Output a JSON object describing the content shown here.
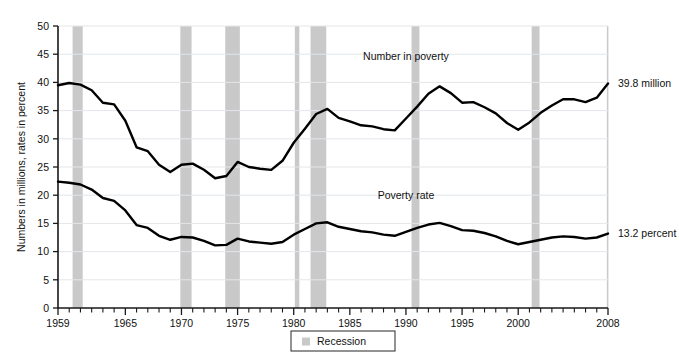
{
  "chart_data": {
    "type": "line",
    "title": "",
    "subtitle": "",
    "xlabel": "",
    "ylabel": "Numbers in millions, rates in percent",
    "xlim": [
      1959,
      2008
    ],
    "ylim": [
      0,
      50
    ],
    "grid": true,
    "legend_position": "bottom-center",
    "x": [
      1959,
      1960,
      1961,
      1962,
      1963,
      1964,
      1965,
      1966,
      1967,
      1968,
      1969,
      1970,
      1971,
      1972,
      1973,
      1974,
      1975,
      1976,
      1977,
      1978,
      1979,
      1980,
      1981,
      1982,
      1983,
      1984,
      1985,
      1986,
      1987,
      1988,
      1989,
      1990,
      1991,
      1992,
      1993,
      1994,
      1995,
      1996,
      1997,
      1998,
      1999,
      2000,
      2001,
      2002,
      2003,
      2004,
      2005,
      2006,
      2007,
      2008
    ],
    "x_tick_labels": [
      "1959",
      "1965",
      "1970",
      "1975",
      "1980",
      "1985",
      "1990",
      "1995",
      "2000",
      "2008"
    ],
    "x_tick_values": [
      1959,
      1965,
      1970,
      1975,
      1980,
      1985,
      1990,
      1995,
      2000,
      2008
    ],
    "x_minor_tick_step": 1,
    "y_tick_labels": [
      "0",
      "5",
      "10",
      "15",
      "20",
      "25",
      "30",
      "35",
      "40",
      "45",
      "50"
    ],
    "y_tick_values": [
      0,
      5,
      10,
      15,
      20,
      25,
      30,
      35,
      40,
      45,
      50
    ],
    "series": [
      {
        "name": "Number in poverty",
        "unit": "millions",
        "label_x": 1990,
        "label_y": 44.0,
        "end_label": "39.8 million",
        "color": "#000000",
        "values": [
          39.5,
          39.9,
          39.6,
          38.6,
          36.4,
          36.1,
          33.2,
          28.5,
          27.8,
          25.4,
          24.1,
          25.4,
          25.6,
          24.5,
          23.0,
          23.4,
          25.9,
          25.0,
          24.7,
          24.5,
          26.1,
          29.3,
          31.8,
          34.4,
          35.3,
          33.7,
          33.1,
          32.4,
          32.2,
          31.7,
          31.5,
          33.6,
          35.7,
          38.0,
          39.3,
          38.1,
          36.4,
          36.5,
          35.6,
          34.5,
          32.8,
          31.6,
          32.9,
          34.6,
          35.9,
          37.0,
          37.0,
          36.5,
          37.3,
          39.8
        ]
      },
      {
        "name": "Poverty rate",
        "unit": "percent",
        "label_x": 1990,
        "label_y": 19.3,
        "end_label": "13.2 percent",
        "color": "#000000",
        "values": [
          22.4,
          22.2,
          21.9,
          21.0,
          19.5,
          19.0,
          17.3,
          14.7,
          14.2,
          12.8,
          12.1,
          12.6,
          12.5,
          11.9,
          11.1,
          11.2,
          12.3,
          11.8,
          11.6,
          11.4,
          11.7,
          13.0,
          14.0,
          15.0,
          15.2,
          14.4,
          14.0,
          13.6,
          13.4,
          13.0,
          12.8,
          13.5,
          14.2,
          14.8,
          15.1,
          14.5,
          13.8,
          13.7,
          13.3,
          12.7,
          11.9,
          11.3,
          11.7,
          12.1,
          12.5,
          12.7,
          12.6,
          12.3,
          12.5,
          13.2
        ]
      }
    ],
    "recession_bands": [
      {
        "start": 1960.3,
        "end": 1961.2
      },
      {
        "start": 1969.9,
        "end": 1970.9
      },
      {
        "start": 1973.9,
        "end": 1975.2
      },
      {
        "start": 1980.1,
        "end": 1980.5
      },
      {
        "start": 1981.5,
        "end": 1982.9
      },
      {
        "start": 1990.5,
        "end": 1991.2
      },
      {
        "start": 2001.2,
        "end": 2001.9
      },
      {
        "start": 2007.9,
        "end": 2008.6
      }
    ],
    "legend": [
      {
        "label": "Recession",
        "swatch_color": "#c9c9c9"
      }
    ]
  },
  "colors": {
    "band": "#c9c9c9",
    "line": "#000000",
    "grid": "#e3e6ea",
    "axis": "#1a1a1a",
    "background": "#ffffff"
  }
}
